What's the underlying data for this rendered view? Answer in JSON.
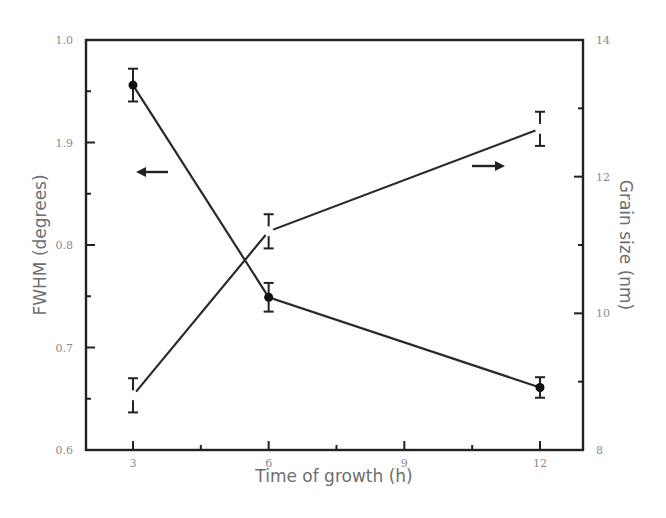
{
  "chart_data": {
    "type": "line",
    "title": "",
    "xlabel": "Time of growth (h)",
    "ylabel": "FWHM (degrees)",
    "y2label": "Grain size (nm)",
    "x": [
      3,
      6,
      12
    ],
    "xlim": [
      0,
      15
    ],
    "xticks": [
      3,
      6,
      9,
      12
    ],
    "xtick_labels": [
      "3",
      "6",
      "9",
      "12"
    ],
    "ylim": [
      0.6,
      1.0
    ],
    "yticks": [
      0.6,
      0.7,
      0.8,
      0.9,
      1.0
    ],
    "ytick_labels": [
      "0.6",
      "0.7",
      "0.8",
      "1.9",
      "1.0"
    ],
    "y2lim": [
      8,
      14
    ],
    "y2ticks": [
      8,
      10,
      12,
      14
    ],
    "y2tick_labels": [
      "8",
      "10",
      "12",
      "14"
    ],
    "grid": false,
    "legend": "none (arrows indicate axis)",
    "series": [
      {
        "name": "FWHM",
        "axis": "left",
        "marker": "filled-circle",
        "values": [
          0.956,
          0.749,
          0.661
        ],
        "errors": [
          0.016,
          0.014,
          0.01
        ]
      },
      {
        "name": "Grain size",
        "axis": "right",
        "marker": "open-circle",
        "values": [
          8.8,
          11.2,
          12.7
        ],
        "errors": [
          0.25,
          0.25,
          0.25
        ]
      }
    ],
    "annotations": [
      {
        "type": "arrow",
        "direction": "left",
        "points_to": "FWHM axis",
        "near": [
          3.6,
          0.875
        ]
      },
      {
        "type": "arrow",
        "direction": "right",
        "points_to": "Grain size axis",
        "near": [
          11.3,
          12.15
        ]
      }
    ]
  }
}
